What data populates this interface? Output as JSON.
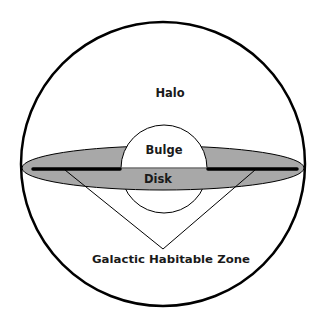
{
  "diagram": {
    "labels": {
      "halo": "Halo",
      "bulge": "Bulge",
      "disk": "Disk",
      "ghz": "Galactic Habitable Zone"
    },
    "colors": {
      "background": "#ffffff",
      "outline": "#000000",
      "disk_fill": "#a8a8a8",
      "bulge_fill": "#ffffff",
      "text": "#1a1a1a"
    },
    "shapes": {
      "halo_circle": {
        "cx": 163,
        "cy": 164,
        "r": 142
      },
      "disk_ellipse": {
        "cx": 163,
        "cy": 168,
        "rx": 141,
        "ry": 22
      },
      "bulge_circle": {
        "cx": 164,
        "cy": 165,
        "r": 43
      },
      "ghz_bands": [
        {
          "x1": 33,
          "x2": 120,
          "y": 169
        },
        {
          "x1": 208,
          "x2": 297,
          "y": 169
        }
      ],
      "ghz_pointer": {
        "left": [
          65,
          170
        ],
        "apex": [
          163,
          249
        ],
        "right": [
          255,
          170
        ]
      }
    }
  }
}
